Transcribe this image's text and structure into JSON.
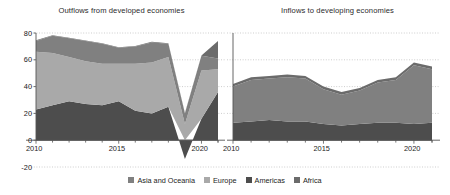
{
  "figure": {
    "background": "#ffffff",
    "gridline_color": "#b9b9b9",
    "axis_color": "#555555",
    "text_color": "#1d1d1d"
  },
  "legend": {
    "position": "bottom-center",
    "items": [
      {
        "label": "Asia and Oceania",
        "color": "#808080",
        "name": "legend-asia-and-oceania"
      },
      {
        "label": "Europe",
        "color": "#a9a9a9",
        "name": "legend-europe"
      },
      {
        "label": "Americas",
        "color": "#4d4d4d",
        "name": "legend-americas"
      },
      {
        "label": "Africa",
        "color": "#6b6b6b",
        "name": "legend-africa"
      }
    ]
  },
  "chart_data": [
    {
      "type": "area",
      "stacked": true,
      "title": "Outflows from developed economies",
      "xlabel": "",
      "ylabel": "",
      "grid": true,
      "legend": "bottom",
      "xlim": [
        2010,
        2021
      ],
      "ylim": [
        -20,
        80
      ],
      "yticks": [
        -20,
        0,
        20,
        40,
        60,
        80
      ],
      "ytick_labels": [
        "-20",
        "0",
        "20",
        "40",
        "60",
        "80"
      ],
      "x": [
        2010,
        2011,
        2012,
        2013,
        2014,
        2015,
        2016,
        2017,
        2018,
        2019,
        2020,
        2021
      ],
      "xticks": [
        2010,
        2015,
        2020
      ],
      "xtick_labels": [
        "2010",
        "2015",
        "2020"
      ],
      "series": [
        {
          "name": "Americas",
          "color": "#4d4d4d",
          "values": [
            23,
            26,
            29,
            27,
            26,
            29,
            22,
            20,
            25,
            -14,
            16,
            36
          ]
        },
        {
          "name": "Europe",
          "color": "#a9a9a9",
          "values": [
            43,
            39,
            33,
            32,
            31,
            28,
            35,
            38,
            37,
            12,
            36,
            17
          ]
        },
        {
          "name": "Asia and Oceania",
          "color": "#808080",
          "values": [
            8,
            13,
            14,
            15,
            15,
            12,
            13,
            15,
            10,
            8,
            11,
            8
          ]
        },
        {
          "name": "Africa",
          "color": "#6b6b6b",
          "values": [
            0.5,
            0.4,
            0.4,
            0.4,
            0.4,
            0.3,
            0.3,
            0.4,
            0.3,
            0.3,
            0.3,
            13
          ]
        }
      ]
    },
    {
      "type": "area",
      "stacked": true,
      "title": "Inflows to developing economies",
      "xlabel": "",
      "ylabel": "",
      "grid": true,
      "legend": "bottom",
      "xlim": [
        2010,
        2021
      ],
      "ylim": [
        -20,
        80
      ],
      "yticks": [
        -20,
        0,
        20,
        40,
        60,
        80
      ],
      "ytick_labels": [
        "-20",
        "0",
        "20",
        "40",
        "60",
        "80"
      ],
      "x": [
        2010,
        2011,
        2012,
        2013,
        2014,
        2015,
        2016,
        2017,
        2018,
        2019,
        2020,
        2021
      ],
      "xticks": [
        2010,
        2015,
        2020
      ],
      "xtick_labels": [
        "2010",
        "2015",
        "2020"
      ],
      "series": [
        {
          "name": "Americas",
          "color": "#4d4d4d",
          "values": [
            13,
            14,
            15,
            14,
            14,
            12,
            11,
            12,
            13,
            13,
            12,
            13
          ]
        },
        {
          "name": "Asia and Oceania",
          "color": "#808080",
          "values": [
            27,
            31,
            31,
            33,
            32,
            26,
            23,
            25,
            30,
            32,
            44,
            40
          ]
        },
        {
          "name": "Africa",
          "color": "#6b6b6b",
          "values": [
            2,
            2,
            2,
            2,
            2,
            2,
            2,
            2,
            2,
            2,
            2,
            2
          ]
        }
      ]
    }
  ]
}
